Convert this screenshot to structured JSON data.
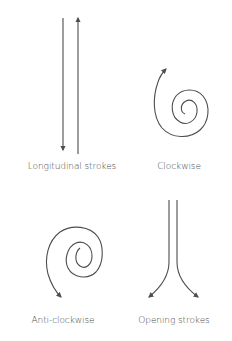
{
  "diagram": {
    "panels": [
      {
        "id": "longitudinal",
        "label": "Longitudinal strokes",
        "description": "two parallel vertical strokes, left pointing down, right pointing up"
      },
      {
        "id": "clockwise",
        "label": "Clockwise",
        "description": "spiral winding clockwise outward with arrow at top-left"
      },
      {
        "id": "anticlockwise",
        "label": "Anti-clockwise",
        "description": "spiral winding anti-clockwise outward with arrow at bottom-left"
      },
      {
        "id": "opening",
        "label": "Opening strokes",
        "description": "two parallel vertical strokes that diverge at the bottom with arrows pointing outward"
      }
    ],
    "colors": {
      "stroke": "#4d4d4d",
      "text": "#4a4a4a",
      "background": "#ffffff"
    }
  }
}
